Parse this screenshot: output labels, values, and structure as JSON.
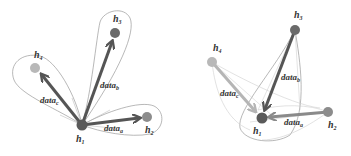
{
  "colors": {
    "h1": "#5a5a5a",
    "h2": "#8c8c8c",
    "h3": "#6a6a6a",
    "h4": "#b8b8b8",
    "arrow_dark": "#555555",
    "arrow_mid": "#888888",
    "arrow_light": "#b5b5b5",
    "boundary": "#9a9a9a",
    "boundary_light": "#cfcfcf"
  },
  "left_diagram": {
    "nodes": [
      {
        "id": "h1",
        "label": "h",
        "sub": "1",
        "x": 82,
        "y": 125,
        "lx": 76,
        "ly": 142
      },
      {
        "id": "h2",
        "label": "h",
        "sub": "2",
        "x": 147,
        "y": 117,
        "lx": 145,
        "ly": 133
      },
      {
        "id": "h3",
        "label": "h",
        "sub": "3",
        "x": 115,
        "y": 33,
        "lx": 113,
        "ly": 22
      },
      {
        "id": "h4",
        "label": "h",
        "sub": "4",
        "x": 35,
        "y": 68,
        "lx": 34,
        "ly": 58
      }
    ],
    "edges": [
      {
        "from": "h1",
        "to": "h2",
        "label": "data",
        "sub": "a",
        "lx": 104,
        "ly": 131
      },
      {
        "from": "h1",
        "to": "h3",
        "label": "data",
        "sub": "b",
        "lx": 100,
        "ly": 88
      },
      {
        "from": "h1",
        "to": "h4",
        "label": "data",
        "sub": "c",
        "lx": 40,
        "ly": 103
      }
    ]
  },
  "right_diagram": {
    "nodes": [
      {
        "id": "h1",
        "label": "h",
        "sub": "1",
        "x": 262,
        "y": 118,
        "lx": 253,
        "ly": 134
      },
      {
        "id": "h2",
        "label": "h",
        "sub": "2",
        "x": 328,
        "y": 112,
        "lx": 328,
        "ly": 128
      },
      {
        "id": "h3",
        "label": "h",
        "sub": "3",
        "x": 295,
        "y": 30,
        "lx": 294,
        "ly": 18
      },
      {
        "id": "h4",
        "label": "h",
        "sub": "4",
        "x": 212,
        "y": 62,
        "lx": 213,
        "ly": 51
      }
    ],
    "edges": [
      {
        "from": "h2",
        "to": "h1",
        "label": "data",
        "sub": "a",
        "lx": 284,
        "ly": 125
      },
      {
        "from": "h3",
        "to": "h1",
        "label": "data",
        "sub": "b",
        "lx": 281,
        "ly": 80
      },
      {
        "from": "h4",
        "to": "h1",
        "label": "data",
        "sub": "c",
        "lx": 220,
        "ly": 96
      }
    ]
  },
  "labels": {
    "node_prefix": "h",
    "edge_prefix": "data"
  }
}
